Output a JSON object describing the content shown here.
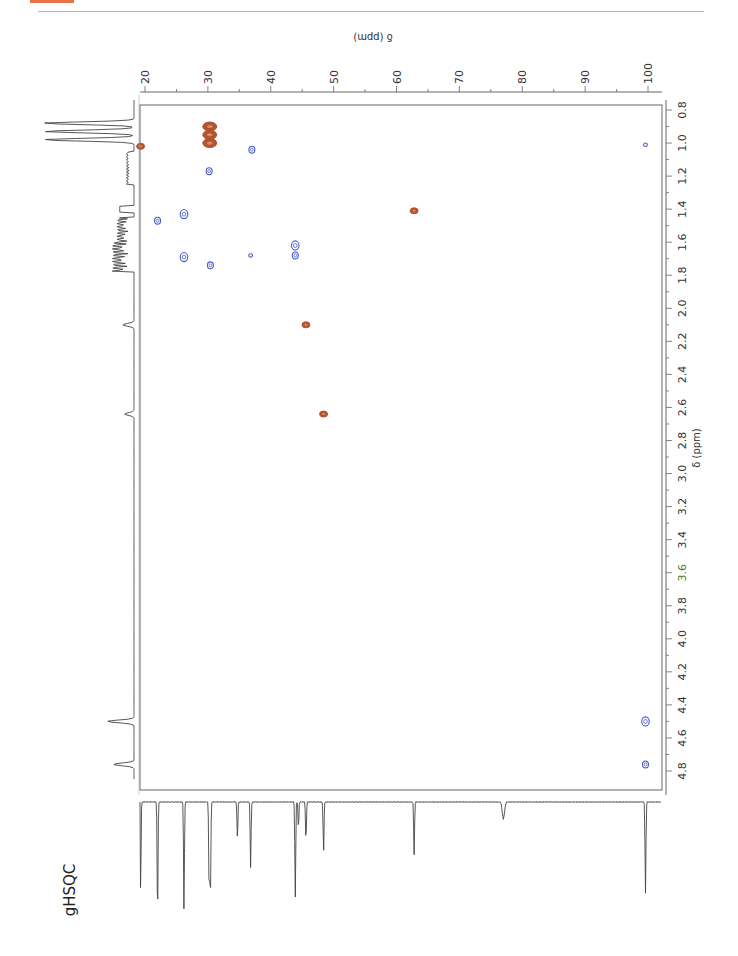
{
  "header": {
    "accent_color": "#e8734a"
  },
  "chart_data": {
    "type": "heatmap",
    "subtype": "2D NMR gHSQC contour plot (rotated 90°)",
    "title": "gHSQC",
    "x_axis": {
      "label": "δ (ppm)",
      "nucleus": "1H",
      "range": [
        0.8,
        4.8
      ],
      "ticks": [
        "0.8",
        "1.0",
        "1.2",
        "1.4",
        "1.6",
        "1.8",
        "2.0",
        "2.2",
        "2.4",
        "2.6",
        "2.8",
        "3.0",
        "3.2",
        "3.4",
        "3.6",
        "3.8",
        "4.0",
        "4.2",
        "4.4",
        "4.6",
        "4.8"
      ]
    },
    "y_axis": {
      "label": "δ (ppm)",
      "nucleus": "13C",
      "range": [
        20,
        100
      ],
      "ticks": [
        "20",
        "30",
        "40",
        "50",
        "60",
        "70",
        "80",
        "90",
        "100"
      ]
    },
    "legend": [
      {
        "name": "CH / CH3 (positive)",
        "color": "#b5532e"
      },
      {
        "name": "CH2 (negative)",
        "color": "#4a5cc8"
      }
    ],
    "cross_peaks": [
      {
        "h": 0.9,
        "c": 30.3,
        "phase": "positive",
        "color": "#b5532e",
        "size": "large"
      },
      {
        "h": 0.95,
        "c": 30.3,
        "phase": "positive",
        "color": "#b5532e",
        "size": "large"
      },
      {
        "h": 1.0,
        "c": 30.3,
        "phase": "positive",
        "color": "#b5532e",
        "size": "large"
      },
      {
        "h": 1.02,
        "c": 19.3,
        "phase": "positive",
        "color": "#b5532e",
        "size": "small"
      },
      {
        "h": 1.04,
        "c": 37.0,
        "phase": "negative",
        "color": "#4a5cc8",
        "size": "small"
      },
      {
        "h": 1.01,
        "c": 99.6,
        "phase": "negative",
        "color": "#4a5cc8",
        "size": "tiny"
      },
      {
        "h": 1.17,
        "c": 30.2,
        "phase": "negative",
        "color": "#4a5cc8",
        "size": "small"
      },
      {
        "h": 1.41,
        "c": 62.8,
        "phase": "positive",
        "color": "#b5532e",
        "size": "small"
      },
      {
        "h": 1.43,
        "c": 26.2,
        "phase": "negative",
        "color": "#4a5cc8",
        "size": "medium"
      },
      {
        "h": 1.47,
        "c": 22.0,
        "phase": "negative",
        "color": "#4a5cc8",
        "size": "small"
      },
      {
        "h": 1.62,
        "c": 43.9,
        "phase": "negative",
        "color": "#4a5cc8",
        "size": "medium"
      },
      {
        "h": 1.68,
        "c": 43.9,
        "phase": "negative",
        "color": "#4a5cc8",
        "size": "small"
      },
      {
        "h": 1.68,
        "c": 36.8,
        "phase": "negative",
        "color": "#4a5cc8",
        "size": "tiny"
      },
      {
        "h": 1.69,
        "c": 26.2,
        "phase": "negative",
        "color": "#4a5cc8",
        "size": "medium"
      },
      {
        "h": 1.74,
        "c": 30.4,
        "phase": "negative",
        "color": "#4a5cc8",
        "size": "small"
      },
      {
        "h": 2.1,
        "c": 45.6,
        "phase": "positive",
        "color": "#b5532e",
        "size": "small"
      },
      {
        "h": 2.64,
        "c": 48.4,
        "phase": "positive",
        "color": "#b5532e",
        "size": "small"
      },
      {
        "h": 4.5,
        "c": 99.6,
        "phase": "negative",
        "color": "#4a5cc8",
        "size": "medium"
      },
      {
        "h": 4.76,
        "c": 99.6,
        "phase": "negative",
        "color": "#4a5cc8",
        "size": "small"
      }
    ],
    "projection_1h": {
      "peaks": [
        {
          "ppm": 0.88,
          "height": 0.95
        },
        {
          "ppm": 0.93,
          "height": 0.95
        },
        {
          "ppm": 0.98,
          "height": 0.95
        },
        {
          "ppm": 2.1,
          "height": 0.12
        },
        {
          "ppm": 2.64,
          "height": 0.1
        },
        {
          "ppm": 4.5,
          "height": 0.28
        },
        {
          "ppm": 4.76,
          "height": 0.22
        }
      ]
    },
    "projection_13c": {
      "peaks": [
        {
          "ppm": 19.3,
          "height": 0.7
        },
        {
          "ppm": 22.0,
          "height": 0.9
        },
        {
          "ppm": 26.2,
          "height": 0.83
        },
        {
          "ppm": 30.2,
          "height": 0.7
        },
        {
          "ppm": 30.4,
          "height": 0.75
        },
        {
          "ppm": 34.7,
          "height": 0.28
        },
        {
          "ppm": 36.8,
          "height": 0.5
        },
        {
          "ppm": 43.9,
          "height": 0.73
        },
        {
          "ppm": 44.4,
          "height": 0.2
        },
        {
          "ppm": 45.6,
          "height": 0.3
        },
        {
          "ppm": 48.4,
          "height": 0.38
        },
        {
          "ppm": 62.8,
          "height": 0.41
        },
        {
          "ppm": 77.0,
          "height": 0.13
        },
        {
          "ppm": 99.6,
          "height": 0.7
        }
      ]
    }
  },
  "labels": {
    "title": "gHSQC",
    "axis_13c": "δ (ppm)",
    "axis_1h": "δ (ppm)"
  }
}
